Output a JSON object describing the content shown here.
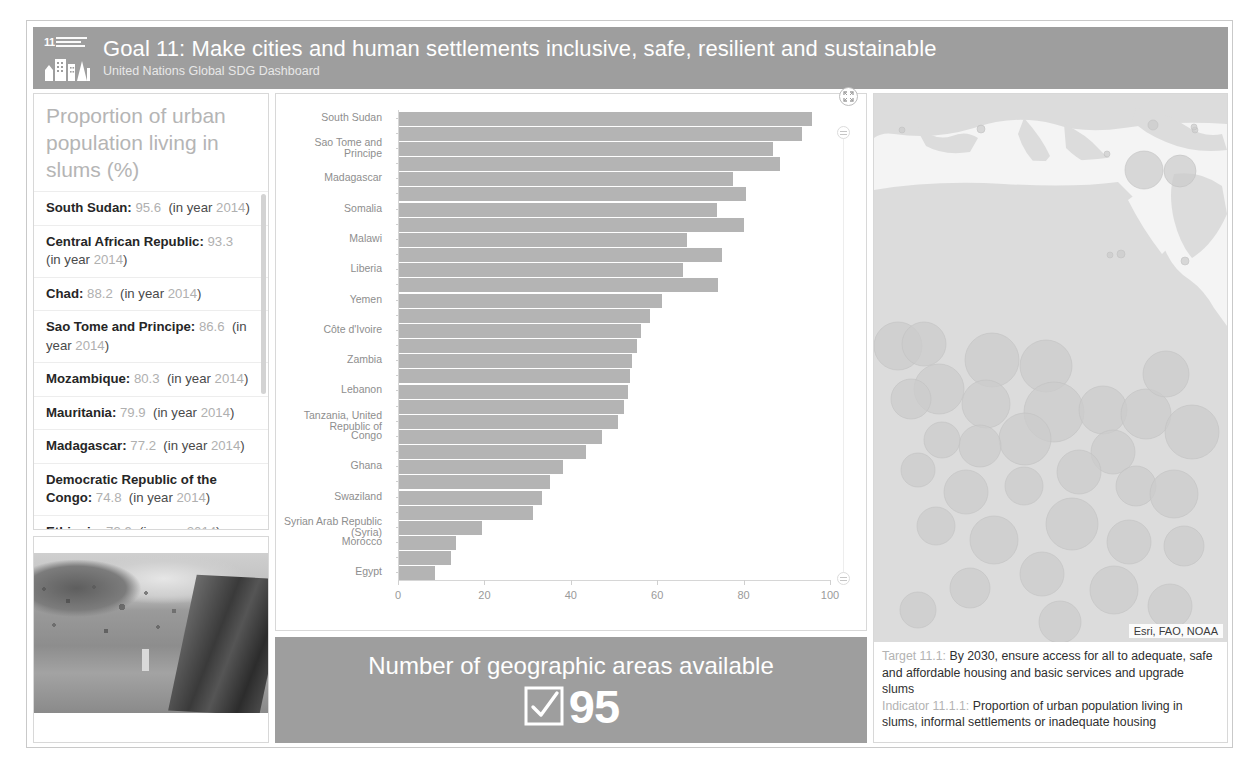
{
  "header": {
    "goal_number": "11",
    "logo_alt": "sdg-goal-11-logo",
    "title": "Goal 11: Make cities and human settlements inclusive, safe, resilient and sustainable",
    "subtitle": "United Nations Global SDG Dashboard"
  },
  "list_panel": {
    "title": "Proportion of urban population living in slums (%)",
    "items": [
      {
        "name": "South Sudan",
        "value": "95.6",
        "year": "2014"
      },
      {
        "name": "Central African Republic",
        "value": "93.3",
        "year": "2014"
      },
      {
        "name": "Chad",
        "value": "88.2",
        "year": "2014"
      },
      {
        "name": "Sao Tome and Principe",
        "value": "86.6",
        "year": "2014"
      },
      {
        "name": "Mozambique",
        "value": "80.3",
        "year": "2014"
      },
      {
        "name": "Mauritania",
        "value": "79.9",
        "year": "2014"
      },
      {
        "name": "Madagascar",
        "value": "77.2",
        "year": "2014"
      },
      {
        "name": "Democratic Republic of the Congo",
        "value": "74.8",
        "year": "2014"
      },
      {
        "name": "Ethiopia",
        "value": "73.9",
        "year": "2014"
      }
    ],
    "in_year_prefix": "(in year ",
    "suffix": ")"
  },
  "kpi": {
    "title": "Number of geographic areas available",
    "value": "95",
    "icon": "checkbox-checked-icon"
  },
  "map": {
    "attribution": "Esri, FAO, NOAA",
    "target_label": "Target 11.1:",
    "target_text": " By 2030, ensure access for all to adequate, safe and affordable housing and basic services and upgrade slums",
    "indicator_label": "Indicator 11.1.1:",
    "indicator_text": " Proportion of urban population living in slums, informal settlements or inadequate housing"
  },
  "chart_data": {
    "type": "bar",
    "orientation": "horizontal",
    "title": "Proportion of urban population living in slums (%)",
    "xlabel": "",
    "ylabel": "",
    "xlim": [
      0,
      100
    ],
    "xticks": [
      0,
      20,
      40,
      60,
      80,
      100
    ],
    "grid": false,
    "legend": null,
    "categories": [
      "South Sudan",
      "Central African Republic",
      "Sao Tome and Principe",
      "Chad",
      "Madagascar",
      "Mozambique",
      "Somalia",
      "Mauritania",
      "Malawi",
      "Democratic Republic of the Congo",
      "Liberia",
      "Ethiopia",
      "Yemen",
      "Sudan",
      "Côte d'Ivoire",
      "Niger",
      "Zambia",
      "Haiti",
      "Lebanon",
      "Nepal",
      "Tanzania, United Republic of",
      "Congo",
      "Guinea",
      "Ghana",
      "Iraq",
      "Swaziland",
      "Bolivia",
      "Syrian Arab Republic (Syria)",
      "Morocco",
      "Jordan",
      "Egypt"
    ],
    "visible_tick_labels": [
      "South Sudan",
      "Sao Tome and Principe",
      "Madagascar",
      "Somalia",
      "Malawi",
      "Liberia",
      "Yemen",
      "Côte d'Ivoire",
      "Zambia",
      "Lebanon",
      "Tanzania, United Republic of",
      "Congo",
      "Ghana",
      "Swaziland",
      "Syrian Arab Republic (Syria)",
      "Morocco",
      "Egypt"
    ],
    "values": [
      95.6,
      93.3,
      86.6,
      88.2,
      77.2,
      80.3,
      73.6,
      79.9,
      66.7,
      74.8,
      65.7,
      73.9,
      60.8,
      58.0,
      56.0,
      55.0,
      54.0,
      53.4,
      53.1,
      52.0,
      50.7,
      46.9,
      43.3,
      37.9,
      35.0,
      33.0,
      31.1,
      19.3,
      13.1,
      12.0,
      8.3
    ],
    "bar_color": "#b4b4b4"
  },
  "chart_controls": {
    "expand_icon": "expand-fullscreen-icon",
    "scroll_grip_icon": "scroll-grip-icon"
  }
}
